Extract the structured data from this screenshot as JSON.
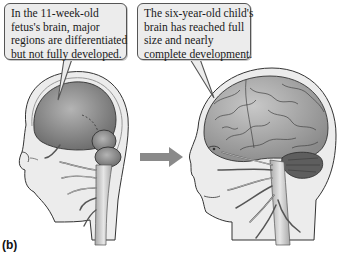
{
  "figure": {
    "panel_label": "(b)",
    "callouts": {
      "fetus": {
        "lines": [
          "In the 11-week-old",
          "fetus's brain, major",
          "regions are differentiated",
          "but not fully developed."
        ]
      },
      "child": {
        "lines": [
          "The six-year-old child's",
          "brain has reached full",
          "size and nearly",
          "complete development."
        ]
      }
    },
    "illustrations": {
      "left": "11-week-old fetus head with developing brain regions",
      "right": "six-year-old child head with fully developed brain",
      "arrow": "right-arrow"
    },
    "colors": {
      "callout_fill": "#ececec",
      "callout_border": "#555555",
      "arrow": "#8a8a8a",
      "brain_fill": "#8c8c8c",
      "skin": "#e8e8e8"
    }
  }
}
